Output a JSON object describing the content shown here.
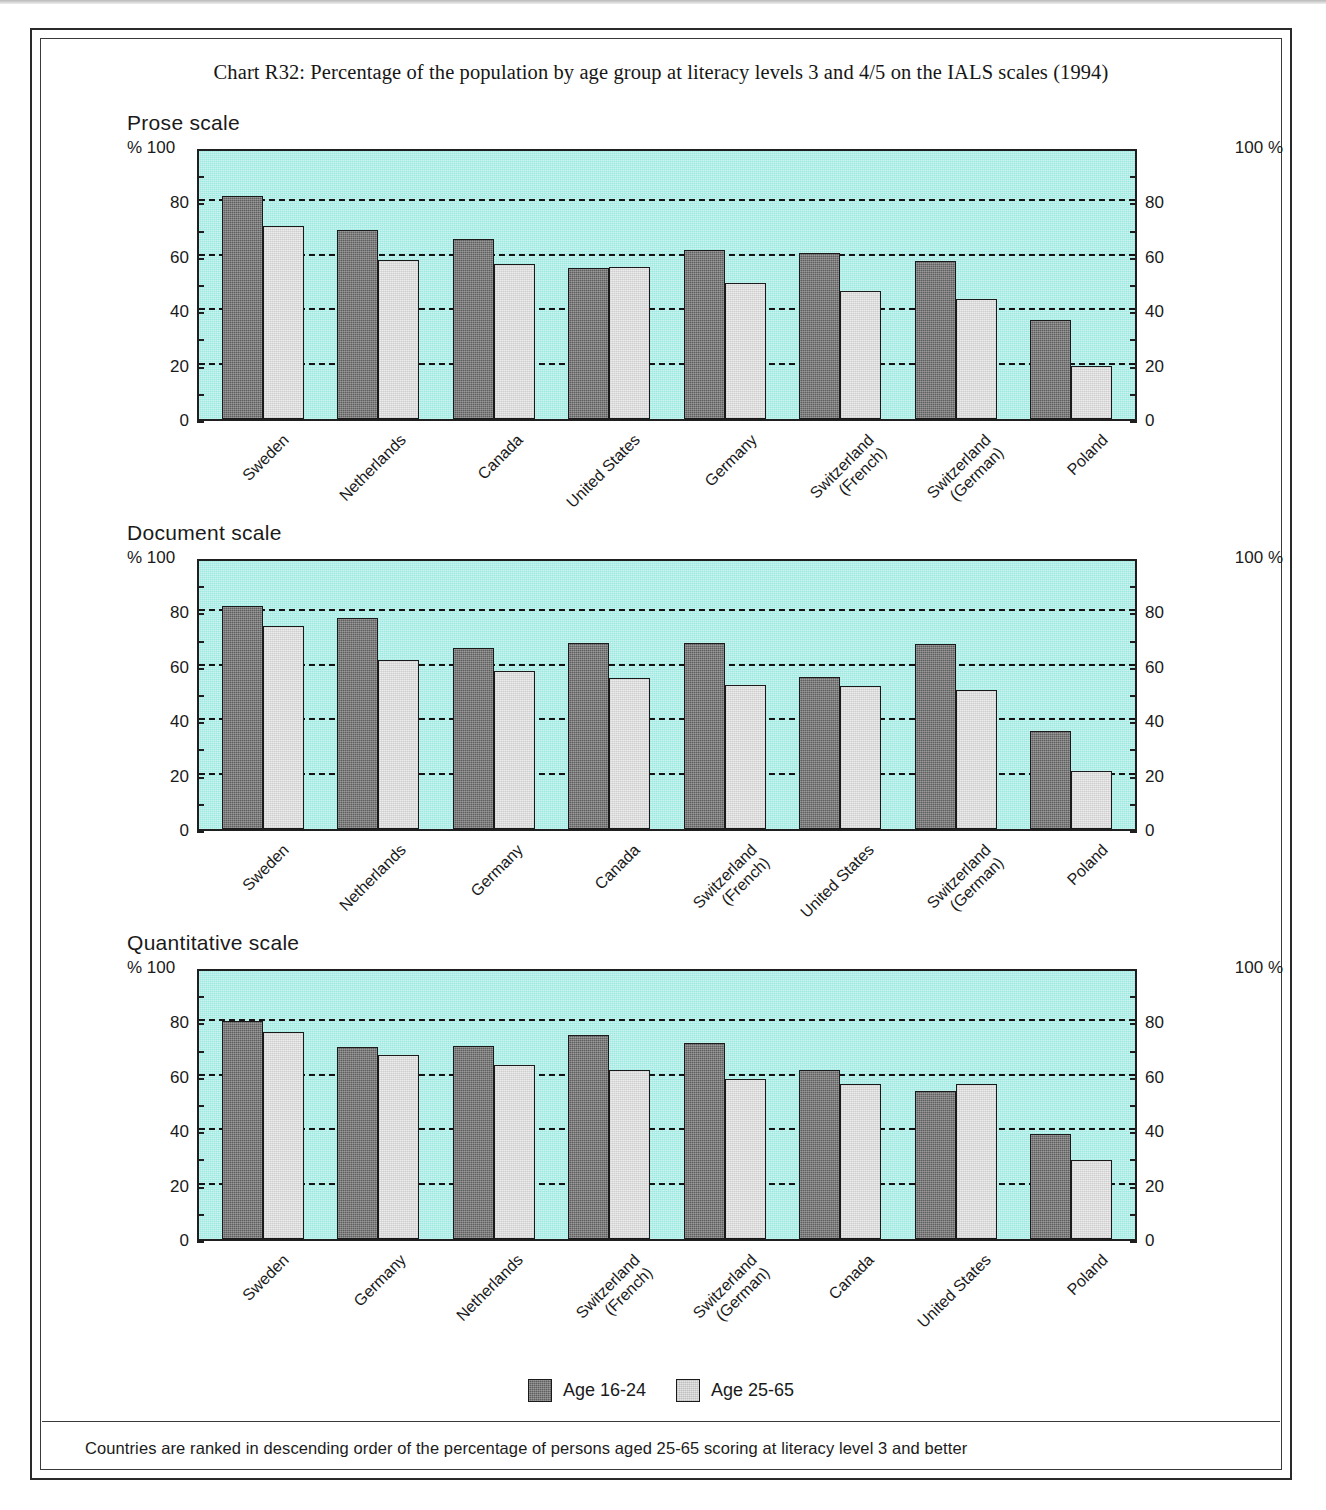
{
  "page": {
    "title": "Chart R32: Percentage of the population by age group at literacy levels 3 and 4/5 on the IALS scales (1994)",
    "footnote": "Countries are ranked in descending order of the percentage of persons aged 25-65 scoring at literacy level 3 and better",
    "axis_unit_left": "% 100",
    "axis_unit_right": "100 %"
  },
  "legend": {
    "items": [
      {
        "label": "Age 16-24",
        "swatch": "dark",
        "color": "#5f5f5f"
      },
      {
        "label": "Age 25-65",
        "swatch": "light",
        "color": "#ececec"
      }
    ]
  },
  "colors": {
    "plot_background": "#9ce9e1",
    "series_16_24": "#5f5f5f",
    "series_25_65": "#ececec",
    "axis": "#1f1f1f",
    "gridline": "#141414"
  },
  "ticks": {
    "labels": [
      "0",
      "20",
      "40",
      "60",
      "80",
      "100"
    ],
    "values": [
      0,
      20,
      40,
      60,
      80,
      100
    ]
  },
  "chart_data": [
    {
      "type": "bar",
      "title": "Prose scale",
      "xlabel": "",
      "ylabel": "%",
      "ylim": [
        0,
        100
      ],
      "grid": true,
      "legend_position": "bottom",
      "categories": [
        "Sweden",
        "Netherlands",
        "Canada",
        "United States",
        "Germany",
        "Switzerland (French)",
        "Switzerland (German)",
        "Poland"
      ],
      "series": [
        {
          "name": "Age 16-24",
          "values": [
            82,
            69.5,
            66,
            55.5,
            62,
            61,
            58,
            36.5
          ]
        },
        {
          "name": "Age 25-65",
          "values": [
            71,
            58.5,
            57,
            56,
            50,
            47,
            44,
            19.5
          ]
        }
      ]
    },
    {
      "type": "bar",
      "title": "Document scale",
      "xlabel": "",
      "ylabel": "%",
      "ylim": [
        0,
        100
      ],
      "grid": true,
      "legend_position": "bottom",
      "categories": [
        "Sweden",
        "Netherlands",
        "Germany",
        "Canada",
        "Switzerland (French)",
        "United States",
        "Switzerland (German)",
        "Poland"
      ],
      "series": [
        {
          "name": "Age 16-24",
          "values": [
            82,
            77.5,
            66.5,
            68.5,
            68.5,
            56,
            68,
            36
          ]
        },
        {
          "name": "Age 25-65",
          "values": [
            74.5,
            62,
            58,
            55.5,
            53,
            52.5,
            51,
            21.5
          ]
        }
      ]
    },
    {
      "type": "bar",
      "title": "Quantitative scale",
      "xlabel": "",
      "ylabel": "%",
      "ylim": [
        0,
        100
      ],
      "grid": true,
      "legend_position": "bottom",
      "categories": [
        "Sweden",
        "Germany",
        "Netherlands",
        "Switzerland (French)",
        "Switzerland (German)",
        "Canada",
        "United States",
        "Poland"
      ],
      "series": [
        {
          "name": "Age 16-24",
          "values": [
            80,
            70.5,
            71,
            75,
            72,
            62,
            54.5,
            38.5
          ]
        },
        {
          "name": "Age 25-65",
          "values": [
            76,
            67.5,
            64,
            62,
            59,
            57,
            57,
            29
          ]
        }
      ]
    }
  ]
}
